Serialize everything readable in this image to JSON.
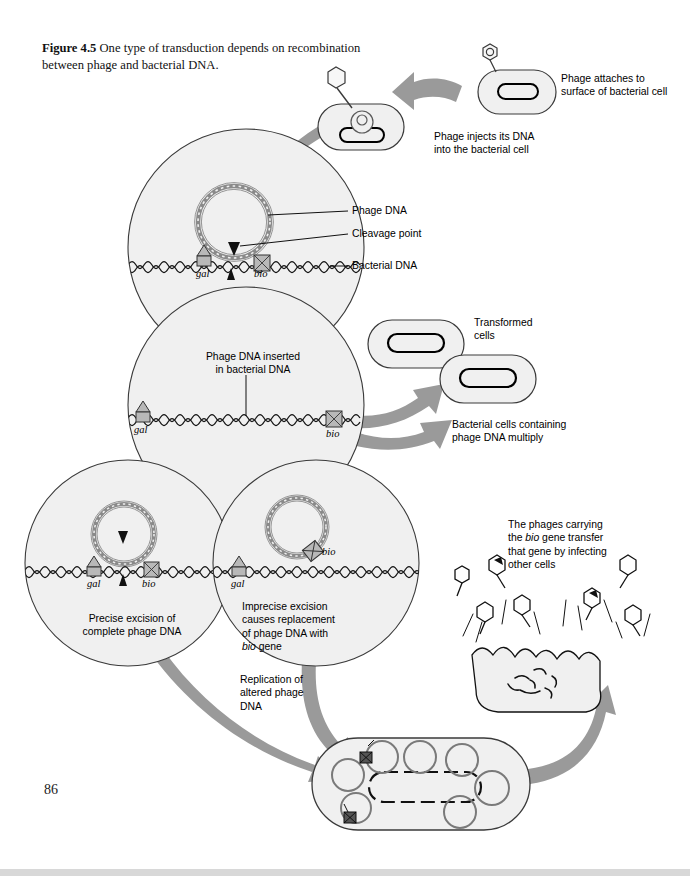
{
  "page": {
    "number": "86",
    "background_color": "#ffffff"
  },
  "figure": {
    "label": "Figure 4.5",
    "caption": "One type of transduction depends on recombination between phage and bacterial DNA.",
    "caption_full": "Figure 4.5   One type of transduction depends on recombination between phage and bacterial DNA."
  },
  "colors": {
    "arrow_gray": "#9a9a9a",
    "cell_fill": "#f0f0f0",
    "cell_stroke": "#3a3a3a",
    "dna_stroke": "#1a1a1a",
    "phage_dna_stroke": "#7a7a7a",
    "marker_fill": "#b8b8b8",
    "text": "#000000"
  },
  "steps": [
    {
      "id": "attach",
      "label": "Phage attaches to\nsurface of bacterial cell"
    },
    {
      "id": "inject",
      "label": "Phage injects its DNA\ninto the bacterial cell"
    },
    {
      "id": "inserted",
      "label": "Phage DNA inserted\nin bacterial DNA"
    },
    {
      "id": "transformed",
      "label": "Transformed\ncells"
    },
    {
      "id": "multiply",
      "label": "Bacterial cells containing\nphage DNA multiply"
    },
    {
      "id": "precise",
      "label": "Precise excision of\ncomplete phage DNA"
    },
    {
      "id": "imprecise",
      "label": "Imprecise excision\ncauses replacement\nof phage DNA with\nbio gene"
    },
    {
      "id": "replication",
      "label": "Replication of\naltered phage\nDNA"
    },
    {
      "id": "transfer",
      "label": "The phages carrying\nthe bio gene transfer\nthat gene by infecting\nother cells"
    }
  ],
  "callouts": [
    {
      "id": "phage-dna",
      "label": "Phage DNA"
    },
    {
      "id": "cleavage-point",
      "label": "Cleavage point"
    },
    {
      "id": "bacterial-dna",
      "label": "Bacterial DNA"
    }
  ],
  "genes": {
    "gal": "gal",
    "bio": "bio"
  },
  "gene_markers": [
    {
      "id": "circle1-gal",
      "gene": "gal",
      "shape": "triangle"
    },
    {
      "id": "circle1-bio",
      "gene": "bio",
      "shape": "square"
    },
    {
      "id": "circle2-gal",
      "gene": "gal",
      "shape": "triangle"
    },
    {
      "id": "circle2-bio",
      "gene": "bio",
      "shape": "square"
    },
    {
      "id": "circle3-gal",
      "gene": "gal",
      "shape": "triangle"
    },
    {
      "id": "circle3-bio",
      "gene": "bio",
      "shape": "square"
    },
    {
      "id": "circle4-gal",
      "gene": "gal",
      "shape": "triangle"
    },
    {
      "id": "circle4-bio",
      "gene": "bio",
      "shape": "square"
    }
  ],
  "icons": [
    "phage-icon",
    "bacterial-cell-icon",
    "circular-phage-dna-icon",
    "bacterial-dna-strand-icon",
    "cleavage-arrow-icon",
    "gal-gene-marker-icon",
    "bio-gene-marker-icon",
    "curved-arrow-icon",
    "lysed-cell-icon"
  ]
}
